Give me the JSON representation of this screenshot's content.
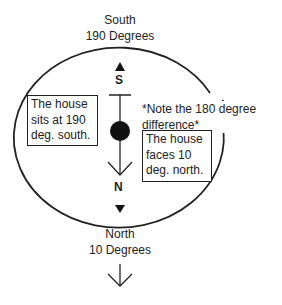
{
  "top_label": {
    "line1": "South",
    "line2": "190 Degrees"
  },
  "bottom_label": {
    "line1": "North",
    "line2": "10 Degrees"
  },
  "compass": {
    "south_letter": "S",
    "north_letter": "N"
  },
  "left_box": {
    "line1": "The house",
    "line2": "sits at 190",
    "line3": "deg. south."
  },
  "note": {
    "line1": "*Note the 180 degree",
    "line2": "difference*"
  },
  "right_box": {
    "line1": "The house",
    "line2": "faces 10",
    "line3": "deg. north."
  }
}
